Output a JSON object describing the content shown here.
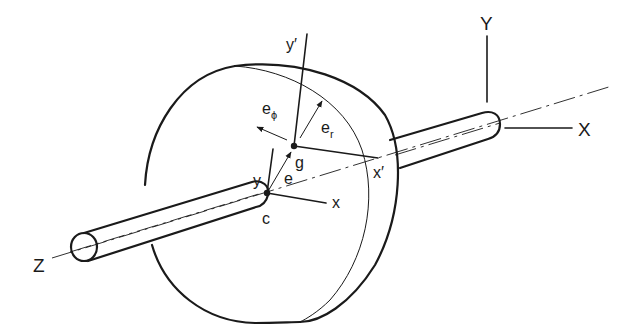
{
  "figure": {
    "colors": {
      "ink": "#1a1a1a",
      "background": "#ffffff"
    }
  },
  "labels": {
    "fixed_Y": "Y",
    "fixed_X": "X",
    "fixed_Z": "Z",
    "rot_y_prime": "y′",
    "rot_x_prime": "x′",
    "e_phi_base": "e",
    "e_phi_sub": "ϕ",
    "e_r_base": "e",
    "e_r_sub": "r",
    "local_y": "y",
    "local_x": "x",
    "point_g": "g",
    "point_c": "c",
    "eccentricity_e": "e"
  }
}
